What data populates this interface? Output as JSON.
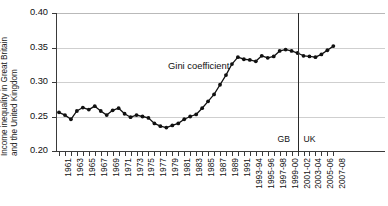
{
  "chart_data": {
    "type": "line",
    "title": "",
    "xlabel": "",
    "ylabel": "Income inequality in Great Britain and the United Kingdom",
    "ylabel_lines": [
      "Income inequality in Great Britain",
      "and the United Kingdom"
    ],
    "ylim": [
      0.2,
      0.4
    ],
    "ytick_labels": [
      "0.40",
      "0.35",
      "0.30",
      "0.25",
      "0.20"
    ],
    "ytick_values": [
      0.4,
      0.35,
      0.3,
      0.25,
      0.2
    ],
    "grid": true,
    "legend": "none",
    "series_name": "Gini coefficient",
    "annotations": [
      {
        "name": "series-label",
        "text": "Gini coefficient"
      },
      {
        "name": "region-left",
        "text": "GB"
      },
      {
        "name": "region-right",
        "text": "UK"
      }
    ],
    "divider": {
      "at_category": "2001-02",
      "left_label": "GB",
      "right_label": "UK"
    },
    "categories": [
      "1961",
      "1962",
      "1963",
      "1964",
      "1965",
      "1966",
      "1967",
      "1968",
      "1969",
      "1970",
      "1971",
      "1972",
      "1973",
      "1974",
      "1975",
      "1976",
      "1977",
      "1978",
      "1979",
      "1980",
      "1981",
      "1982",
      "1983",
      "1984",
      "1985",
      "1986",
      "1987",
      "1988",
      "1989",
      "1990",
      "1991",
      "1992",
      "1993-94",
      "1994-95",
      "1995-96",
      "1996-97",
      "1997-98",
      "1998-99",
      "1999-00",
      "2000-01",
      "2001-02",
      "2002-03",
      "2003-04",
      "2004-05",
      "2005-06",
      "2006-07",
      "2007-08"
    ],
    "tick_labels_shown": [
      "1961",
      "1963",
      "1965",
      "1967",
      "1969",
      "1971",
      "1973",
      "1975",
      "1977",
      "1979",
      "1981",
      "1983",
      "1985",
      "1987",
      "1989",
      "1991",
      "1993-94",
      "1995-96",
      "1997-98",
      "1999-00",
      "2001-02",
      "2003-04",
      "2005-06",
      "2007-08"
    ],
    "values": [
      0.256,
      0.252,
      0.246,
      0.258,
      0.263,
      0.26,
      0.265,
      0.258,
      0.252,
      0.259,
      0.262,
      0.254,
      0.249,
      0.252,
      0.25,
      0.248,
      0.24,
      0.236,
      0.234,
      0.237,
      0.24,
      0.246,
      0.25,
      0.253,
      0.262,
      0.272,
      0.282,
      0.296,
      0.31,
      0.326,
      0.336,
      0.333,
      0.332,
      0.33,
      0.338,
      0.335,
      0.337,
      0.345,
      0.347,
      0.345,
      0.342,
      0.338,
      0.337,
      0.336,
      0.34,
      0.346,
      0.352
    ]
  }
}
